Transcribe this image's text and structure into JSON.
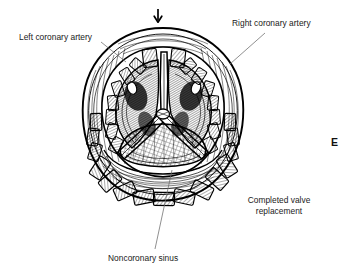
{
  "figure": {
    "panel_letter": "E",
    "labels": {
      "left_coronary_artery": "Left coronary artery",
      "right_coronary_artery": "Right coronary artery",
      "completed_valve_line1": "Completed valve",
      "completed_valve_line2": "replacement",
      "noncoronary_sinus": "Noncoronary sinus"
    },
    "icons": {
      "flow_arrow": "down-arrow-icon"
    },
    "colors": {
      "ink": "#000000",
      "background": "#ffffff",
      "label_text": "#1a1a1a",
      "leader_line": "#555555"
    }
  }
}
